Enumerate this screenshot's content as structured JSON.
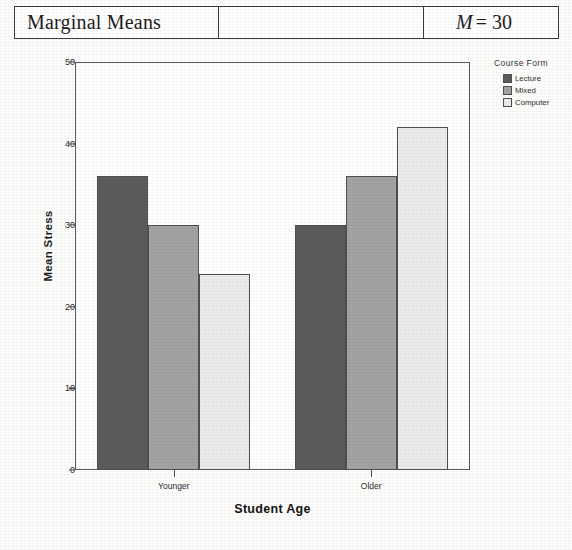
{
  "table": {
    "row_label": "Marginal Means",
    "middle_cell": "",
    "value_italic": "M",
    "value_rest": "= 30"
  },
  "chart_data": {
    "type": "bar",
    "title": "",
    "xlabel": "Student Age",
    "ylabel": "Mean Stress",
    "categories": [
      "Younger",
      "Older"
    ],
    "series": [
      {
        "name": "Lecture",
        "values": [
          36,
          30
        ],
        "color": "#5c5c5c"
      },
      {
        "name": "Mixed",
        "values": [
          30,
          36
        ],
        "color": "#a3a3a3"
      },
      {
        "name": "Computer",
        "values": [
          24,
          42
        ],
        "color": "#ececec"
      }
    ],
    "ylim": [
      0,
      50
    ],
    "yticks": [
      0,
      10,
      20,
      30,
      40,
      50
    ],
    "ytick_labels": [
      "0",
      "10",
      "20",
      "30",
      "40",
      "50"
    ],
    "grid": false,
    "legend_title": "Course Form",
    "legend_position": "right-top"
  },
  "colors": {
    "axis": "#4a4a4a",
    "frame": "#5c5c5c",
    "bar_edge": "#4f4f4f",
    "text": "#1d1d1d",
    "table_border": "#3a3a3a"
  }
}
